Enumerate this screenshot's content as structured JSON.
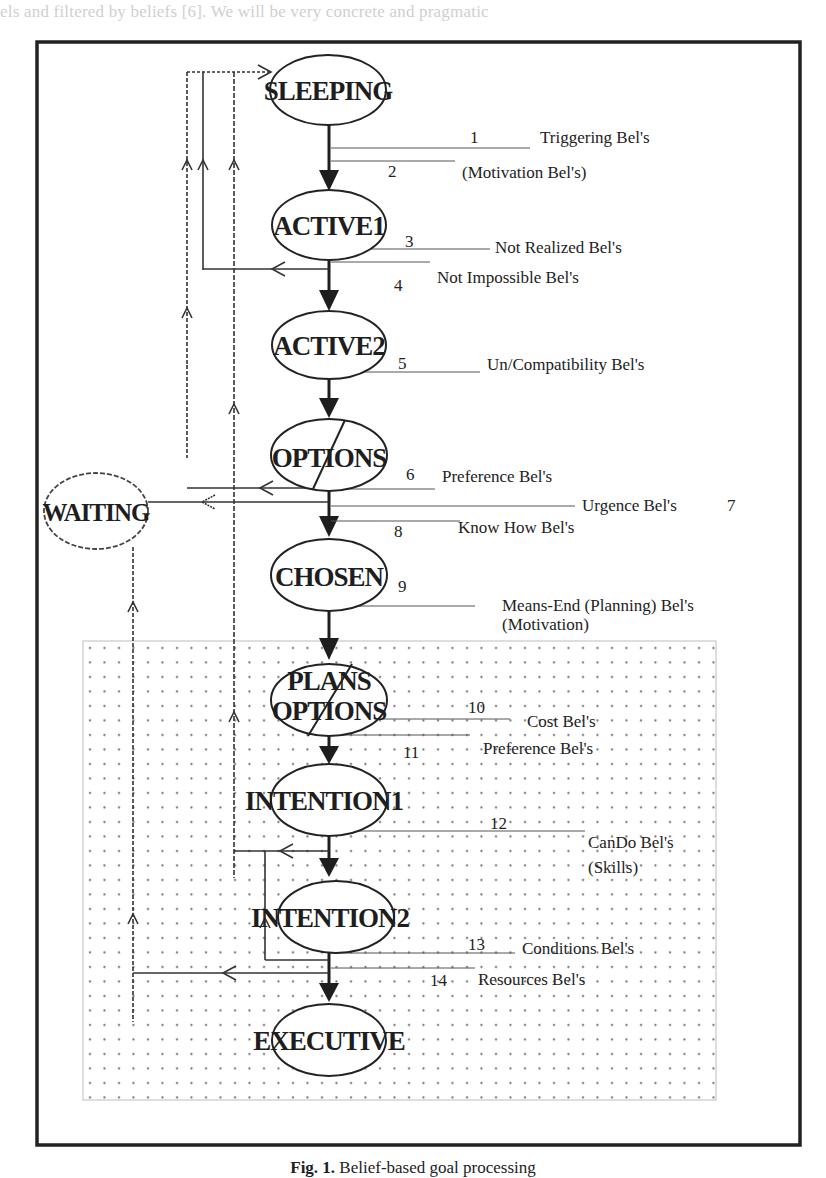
{
  "page": {
    "bleed_text_top": "els and filtered by beliefs [6]. We will be very concrete and pragmatic",
    "caption_prefix": "Fig. 1.",
    "caption_text": "Belief-based goal processing"
  },
  "diagram": {
    "states": [
      {
        "id": "sleeping",
        "label": "SLEEPING"
      },
      {
        "id": "active1",
        "label": "ACTIVE1"
      },
      {
        "id": "active2",
        "label": "ACTIVE2"
      },
      {
        "id": "options",
        "label": "OPTIONS"
      },
      {
        "id": "chosen",
        "label": "CHOSEN"
      },
      {
        "id": "plans-options",
        "label_line1": "PLANS",
        "label_line2": "OPTIONS"
      },
      {
        "id": "intention1",
        "label": "INTENTION1"
      },
      {
        "id": "intention2",
        "label": "INTENTION2"
      },
      {
        "id": "executive",
        "label": "EXECUTIVE"
      },
      {
        "id": "waiting",
        "label": "WAITING"
      }
    ],
    "filters": [
      {
        "num": "1",
        "label": "Triggering Bel's"
      },
      {
        "num": "2",
        "label": "(Motivation Bel's)"
      },
      {
        "num": "3",
        "label": "Not  Realized Bel's"
      },
      {
        "num": "4",
        "label": "Not Impossible Bel's"
      },
      {
        "num": "5",
        "label": "Un/Compatibility Bel's"
      },
      {
        "num": "6",
        "label": "Preference Bel's"
      },
      {
        "num": "7",
        "label": "Urgence Bel's"
      },
      {
        "num": "8",
        "label": "Know How Bel's"
      },
      {
        "num": "9",
        "label": "Means-End (Planning) Bel's",
        "label2": "(Motivation)"
      },
      {
        "num": "10",
        "label": "Cost Bel's"
      },
      {
        "num": "11",
        "label": "Preference Bel's"
      },
      {
        "num": "12",
        "label": "CanDo Bel's",
        "label2": "(Skills)"
      },
      {
        "num": "13",
        "label": "Conditions Bel's"
      },
      {
        "num": "14",
        "label": "Resources Bel's"
      }
    ]
  }
}
